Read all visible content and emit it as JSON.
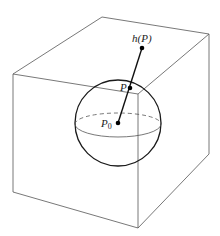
{
  "figure": {
    "labels": {
      "h_of_p": "h(P)",
      "p": "P",
      "p0_main": "P",
      "p0_sub": "0"
    },
    "colors": {
      "cube_edge": "#555555",
      "sphere": "#1a1a1a",
      "segment": "#111111",
      "point": "#000000"
    }
  }
}
